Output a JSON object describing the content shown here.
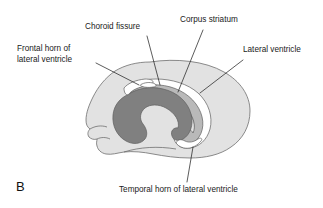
{
  "figure": {
    "panel_letter": "B",
    "background_color": "#ffffff"
  },
  "labels": {
    "choroid_fissure": "Choroid fissure",
    "corpus_striatum": "Corpus striatum",
    "frontal_horn_line1": "Frontal horn of",
    "frontal_horn_line2": "lateral ventricle",
    "lateral_ventricle": "Lateral ventricle",
    "temporal_horn": "Temporal horn of lateral ventricle"
  },
  "colors": {
    "cerebrum_fill": "#e2e2e2",
    "cerebrum_stroke": "#6f6f6f",
    "ventricle_fill": "#ffffff",
    "ventricle_stroke": "#5f5f5f",
    "striatum_fill": "#808080",
    "striatum_stroke": "#5f5f5f",
    "inner_band_fill": "#b9b9b9",
    "leader_stroke": "#262626",
    "text_color": "#1a1a1a"
  },
  "structures": [
    {
      "name": "cerebrum",
      "label": "Cerebral hemisphere outline",
      "fill": "#e2e2e2"
    },
    {
      "name": "lateral-ventricle",
      "label": "Lateral ventricle",
      "fill": "#ffffff"
    },
    {
      "name": "corpus-striatum",
      "label": "Corpus striatum",
      "fill": "#808080"
    },
    {
      "name": "choroid-fissure",
      "label": "Choroid fissure",
      "fill": "#ffffff"
    },
    {
      "name": "frontal-horn",
      "label": "Frontal horn of lateral ventricle",
      "fill": "#ffffff"
    },
    {
      "name": "temporal-horn",
      "label": "Temporal horn of lateral ventricle",
      "fill": "#ffffff"
    }
  ]
}
